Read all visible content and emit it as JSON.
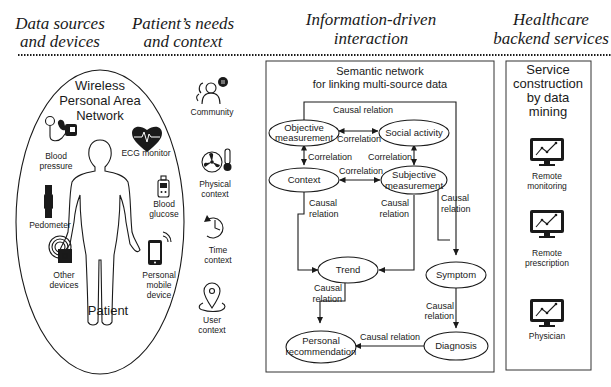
{
  "headers": [
    {
      "line1": "Data sources",
      "line2": "and devices"
    },
    {
      "line1": "Patient’s needs",
      "line2": "and context"
    },
    {
      "line1": "Information-driven",
      "line2": "interaction"
    },
    {
      "line1": "Healthcare",
      "line2": "backend services"
    }
  ],
  "wpan": {
    "title": [
      "Wireless",
      "Personal Area",
      "Network"
    ],
    "patient_label": "Patient",
    "devices": [
      {
        "icon": "blood-pressure-icon",
        "label": [
          "Blood",
          "pressure"
        ]
      },
      {
        "icon": "ecg-monitor-icon",
        "label": [
          "ECG monitor"
        ]
      },
      {
        "icon": "blood-glucose-icon",
        "label": [
          "Blood",
          "glucose"
        ]
      },
      {
        "icon": "pedometer-icon",
        "label": [
          "Pedometer"
        ]
      },
      {
        "icon": "other-devices-icon",
        "label": [
          "Other",
          "devices"
        ]
      },
      {
        "icon": "mobile-device-icon",
        "label": [
          "Personal",
          "mobile",
          "device"
        ]
      }
    ]
  },
  "context": [
    {
      "icon": "community-icon",
      "label": [
        "Community"
      ]
    },
    {
      "icon": "physical-context-icon",
      "label": [
        "Physical",
        "context"
      ]
    },
    {
      "icon": "time-context-icon",
      "label": [
        "Time",
        "context"
      ]
    },
    {
      "icon": "user-context-icon",
      "label": [
        "User",
        "context"
      ]
    }
  ],
  "semantic_network": {
    "title": [
      "Semantic network",
      "for linking multi-source data"
    ],
    "nodes": {
      "objective": [
        "Objective",
        "measurement"
      ],
      "social": [
        "Social activity"
      ],
      "context": [
        "Context"
      ],
      "subjective": [
        "Subjective",
        "measurement"
      ],
      "trend": [
        "Trend"
      ],
      "symptom": [
        "Symptom"
      ],
      "recommendation": [
        "Personal",
        "recommendation"
      ],
      "diagnosis": [
        "Diagnosis"
      ]
    },
    "edges": {
      "top_causal": "Causal relation",
      "obj_social": "Correlation",
      "obj_context": "Correlation",
      "social_subj": "Correlation",
      "context_subj": "Correlation",
      "context_trend": [
        "Causal",
        "relation"
      ],
      "subj_trend": [
        "Causal",
        "relation"
      ],
      "subj_symptom": [
        "Causal",
        "relation"
      ],
      "trend_rec": [
        "Causal",
        "relation"
      ],
      "symptom_diag": [
        "Causal",
        "relation"
      ],
      "diag_rec": "Causal relation"
    }
  },
  "services": {
    "title": [
      "Service",
      "construction",
      "by data",
      "mining"
    ],
    "items": [
      {
        "icon": "monitor-chart-icon",
        "label": [
          "Remote",
          "monitoring"
        ]
      },
      {
        "icon": "monitor-chart-icon",
        "label": [
          "Remote",
          "prescription"
        ]
      },
      {
        "icon": "monitor-chart-icon",
        "label": [
          "Physician"
        ]
      }
    ]
  }
}
